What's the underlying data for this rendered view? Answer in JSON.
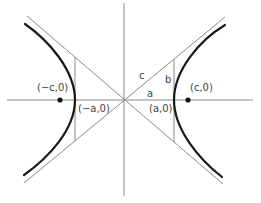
{
  "diagram": {
    "colors": {
      "background": "#ffffff",
      "axis": "#8a8a8a",
      "asymptote": "#8a8a8a",
      "hyperbola": "#1a1a1a",
      "focus_point": "#111111",
      "label": "#444444"
    },
    "labels": {
      "neg_focus": "(−c,0)",
      "pos_focus": "(c,0)",
      "neg_vertex": "(−a,0)",
      "pos_vertex": "(a,0)",
      "side_c": "c",
      "side_b": "b",
      "side_a": "a"
    },
    "geometry": {
      "center": [
        124,
        100
      ],
      "x_axis": {
        "from": [
          7,
          100
        ],
        "to": [
          253,
          100
        ]
      },
      "y_axis": {
        "from": [
          124,
          3
        ],
        "to": [
          124,
          196
        ]
      },
      "asymptote_1": {
        "from": [
          27,
          16
        ],
        "to": [
          223,
          184
        ]
      },
      "asymptote_2": {
        "from": [
          24,
          183
        ],
        "to": [
          225,
          17
        ]
      },
      "left_vertical_segment": {
        "x": 75,
        "y1": 57,
        "y2": 141
      },
      "right_vertical_segment": {
        "x": 174,
        "y1": 59,
        "y2": 142
      },
      "left_focus": [
        60,
        100
      ],
      "right_focus": [
        188,
        100
      ]
    }
  }
}
